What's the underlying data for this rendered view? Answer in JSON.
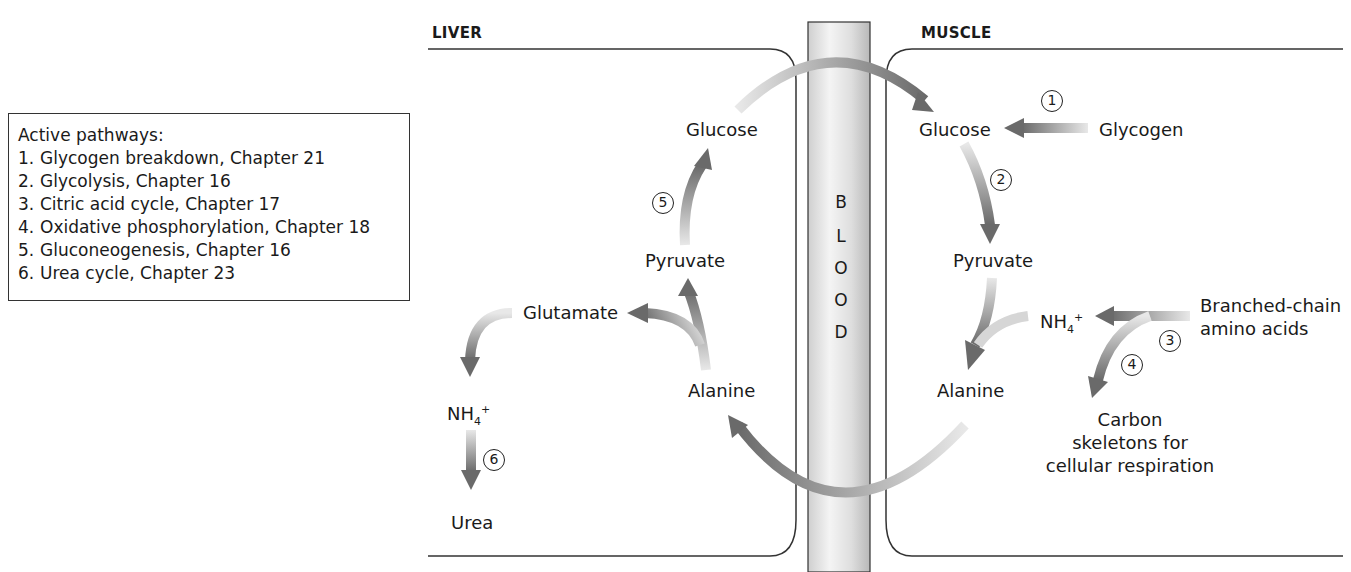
{
  "legend": {
    "title": "Active pathways:",
    "items": [
      {
        "num": "1.",
        "label": "Glycogen breakdown, Chapter 21"
      },
      {
        "num": "2.",
        "label": "Glycolysis, Chapter 16"
      },
      {
        "num": "3.",
        "label": "Citric acid cycle, Chapter 17"
      },
      {
        "num": "4.",
        "label": "Oxidative phosphorylation, Chapter 18"
      },
      {
        "num": "5.",
        "label": "Gluconeogenesis, Chapter 16"
      },
      {
        "num": "6.",
        "label": "Urea cycle, Chapter 23"
      }
    ]
  },
  "regions": {
    "liver": "LIVER",
    "muscle": "MUSCLE",
    "blood_letters": [
      "B",
      "L",
      "O",
      "O",
      "D"
    ]
  },
  "liver": {
    "glucose": "Glucose",
    "pyruvate": "Pyruvate",
    "glutamate": "Glutamate",
    "alanine": "Alanine",
    "nh4_base": "NH",
    "nh4_sub": "4",
    "nh4_sup": "+",
    "urea": "Urea"
  },
  "muscle": {
    "glucose": "Glucose",
    "glycogen": "Glycogen",
    "pyruvate": "Pyruvate",
    "alanine": "Alanine",
    "nh4_base": "NH",
    "nh4_sub": "4",
    "nh4_sup": "+",
    "bcaa_line1": "Branched-chain",
    "bcaa_line2": "amino acids",
    "carbon_line1": "Carbon",
    "carbon_line2": "skeletons for",
    "carbon_line3": "cellular respiration"
  },
  "step_markers": [
    "1",
    "2",
    "3",
    "4",
    "5",
    "6"
  ],
  "colors": {
    "arrow_dark": "#6e6e6e",
    "arrow_light": "#e6e6e6",
    "outline": "#333333",
    "blood_fill": "#e4e4e4"
  }
}
